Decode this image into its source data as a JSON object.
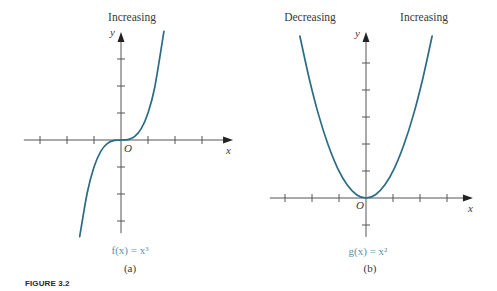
{
  "figure": {
    "caption": "FIGURE 3.2"
  },
  "colors": {
    "curve": "#2b6c84",
    "function_label": "#5b93ad",
    "axis": "#555555",
    "text": "#3a3a3a"
  },
  "chart_data": [
    {
      "type": "line",
      "panel_label": "(a)",
      "function_label": "f(x) = x³",
      "annotations": [
        {
          "text": "Increasing",
          "position": "top"
        }
      ],
      "xlabel": "x",
      "ylabel": "y",
      "origin_label": "O",
      "xlim": [
        -3.6,
        4.15
      ],
      "ylim": [
        -3.45,
        4.0
      ],
      "x_ticks": [
        -3,
        -2,
        -1,
        1,
        2,
        3
      ],
      "y_ticks": [
        -3,
        -2,
        -1,
        1,
        2,
        3
      ],
      "grid": false,
      "series": [
        {
          "name": "f(x) = x³",
          "x": [
            -1.53,
            -1.25,
            -1.0,
            -0.75,
            -0.5,
            -0.25,
            0,
            0.25,
            0.5,
            0.75,
            1.0,
            1.25,
            1.59
          ],
          "y": [
            -3.58,
            -1.953,
            -1.0,
            -0.422,
            -0.125,
            -0.016,
            0,
            0.016,
            0.125,
            0.422,
            1.0,
            1.953,
            4.02
          ]
        }
      ]
    },
    {
      "type": "line",
      "panel_label": "(b)",
      "function_label": "g(x) = x²",
      "annotations": [
        {
          "text": "Decreasing",
          "position": "top-left"
        },
        {
          "text": "Increasing",
          "position": "top-right"
        }
      ],
      "xlabel": "x",
      "ylabel": "y",
      "origin_label": "O",
      "xlim": [
        -3.56,
        3.96
      ],
      "ylim": [
        -1.44,
        6.15
      ],
      "x_ticks": [
        -3,
        -2,
        -1,
        1,
        2,
        3
      ],
      "y_ticks": [
        -1,
        1,
        2,
        3,
        4,
        5
      ],
      "grid": false,
      "series": [
        {
          "name": "g(x) = x²",
          "x": [
            -2.45,
            -2.1,
            -1.75,
            -1.4,
            -1.05,
            -0.7,
            -0.35,
            0,
            0.35,
            0.7,
            1.05,
            1.4,
            1.75,
            2.1,
            2.45
          ],
          "y": [
            6.0,
            4.41,
            3.06,
            1.96,
            1.1,
            0.49,
            0.1225,
            0,
            0.1225,
            0.49,
            1.1,
            1.96,
            3.06,
            4.41,
            6.0
          ]
        }
      ]
    }
  ]
}
